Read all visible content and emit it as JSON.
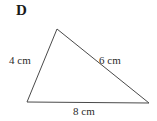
{
  "figure": {
    "shape_label": "D",
    "shape_type": "triangle",
    "background_color": "#ffffff",
    "stroke_color": "#4a4a4a",
    "stroke_width": 1,
    "text_color": "#2b2b2b",
    "vertices": {
      "apex": {
        "x": 57,
        "y": 29
      },
      "bottom_left": {
        "x": 27,
        "y": 102
      },
      "bottom_right": {
        "x": 149,
        "y": 103
      }
    },
    "sides": [
      {
        "name": "left-side",
        "label": "4 cm",
        "value": 4,
        "unit": "cm"
      },
      {
        "name": "right-side",
        "label": "6 cm",
        "value": 6,
        "unit": "cm"
      },
      {
        "name": "base-side",
        "label": "8 cm",
        "value": 8,
        "unit": "cm"
      }
    ]
  }
}
